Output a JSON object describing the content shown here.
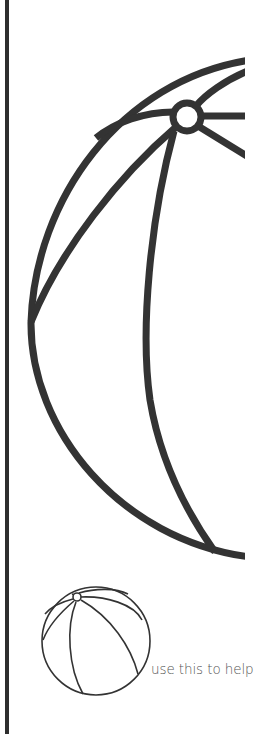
{
  "canvas": {
    "background": "#ffffff",
    "stroke_color": "#333333"
  },
  "left_rule": {
    "color": "#2e2e2e"
  },
  "large_illustration": {
    "subject": "beach-ball-icon",
    "description": "Enlarged beach ball outline, clipped on the right side"
  },
  "reference_illustration": {
    "subject": "beach-ball-icon",
    "description": "Small complete beach ball outline used as reference"
  },
  "hint": {
    "text": "use this to help",
    "color": "#555555"
  }
}
